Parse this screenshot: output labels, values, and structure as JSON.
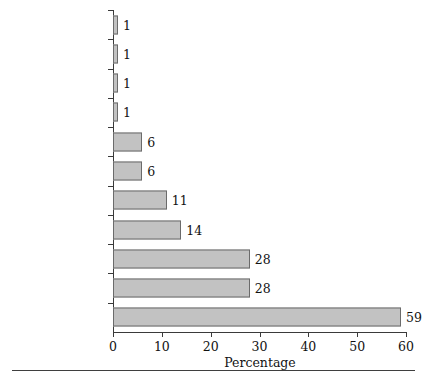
{
  "chart_data": {
    "type": "bar",
    "orientation": "horizontal",
    "title": "",
    "xlabel": "Percentage",
    "ylabel": "",
    "xlim": [
      0,
      60
    ],
    "xticks": [
      0,
      10,
      20,
      30,
      40,
      50,
      60
    ],
    "grid": false,
    "legend": null,
    "bar_color": "#c2c2c2",
    "bar_edge_color": "#6b6b6b",
    "axis_color": "#3a3a3a",
    "show_value_labels": true,
    "categories": [
      "Pets or Third Party",
      "Single Parents",
      "Anti-Homosexual",
      "Religion",
      "Biological Ties",
      "Nuclear Family",
      "Heterosexual",
      "Instrumental",
      "Expressive",
      "Marriage",
      "Children"
    ],
    "values": [
      1,
      1,
      1,
      1,
      6,
      6,
      11,
      14,
      28,
      28,
      59
    ],
    "value_labels": [
      "1",
      "1",
      "1",
      "1",
      "6",
      "6",
      "11",
      "14",
      "28",
      "28",
      "59"
    ],
    "xtick_labels": [
      "0",
      "10",
      "20",
      "30",
      "40",
      "50",
      "60"
    ]
  }
}
